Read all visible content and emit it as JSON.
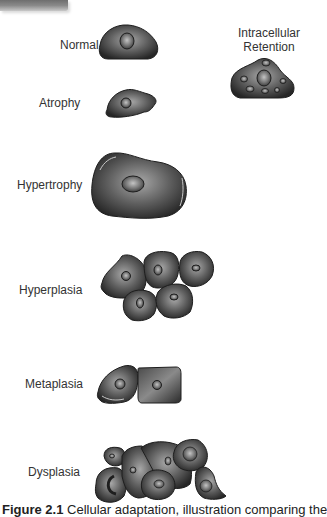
{
  "figure": {
    "labels": {
      "normal": "Normal",
      "atrophy": "Atrophy",
      "hypertrophy": "Hypertrophy",
      "hyperplasia": "Hyperplasia",
      "metaplasia": "Metaplasia",
      "dysplasia": "Dysplasia",
      "intracellular_retention_line1": "Intracellular",
      "intracellular_retention_line2": "Retention"
    },
    "caption": {
      "number": "Figure 2.1",
      "text": "Cellular adaptation, illustration comparing the"
    },
    "colors": {
      "cell_dark": "#2a2a2a",
      "cell_mid": "#6a6a6a",
      "cell_light": "#a8a8a8",
      "label_text": "#333333"
    }
  }
}
